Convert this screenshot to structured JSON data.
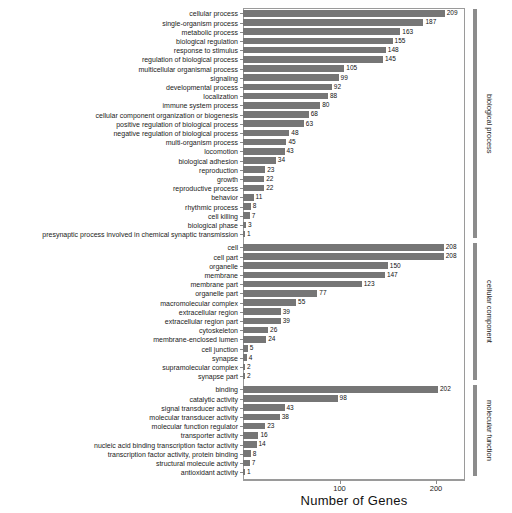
{
  "chart_data": {
    "type": "bar",
    "orientation": "horizontal",
    "title": "",
    "xlabel": "Number of Genes",
    "ylabel": "",
    "xlim": [
      0,
      230
    ],
    "xticks": [
      100,
      200
    ],
    "grid": false,
    "legend": "none",
    "bar_color": "#767676",
    "categories": [
      "cellular process",
      "single-organism process",
      "metabolic process",
      "biological regulation",
      "response to stimulus",
      "regulation of biological process",
      "multicellular organismal process",
      "signaling",
      "developmental process",
      "localization",
      "immune system process",
      "cellular component organization or biogenesis",
      "positive regulation of biological process",
      "negative regulation of biological process",
      "multi-organism process",
      "locomotion",
      "biological adhesion",
      "reproduction",
      "growth",
      "reproductive process",
      "behavior",
      "rhythmic process",
      "cell killing",
      "biological phase",
      "presynaptic process involved in chemical synaptic transmission",
      "cell",
      "cell part",
      "organelle",
      "membrane",
      "membrane part",
      "organelle part",
      "macromolecular complex",
      "extracellular region",
      "extracellular region part",
      "cytoskeleton",
      "membrane-enclosed lumen",
      "cell junction",
      "synapse",
      "supramolecular complex",
      "synapse part",
      "binding",
      "catalytic activity",
      "signal transducer activity",
      "molecular transducer activity",
      "molecular function regulator",
      "transporter activity",
      "nucleic acid binding transcription factor activity",
      "transcription factor activity, protein binding",
      "structural molecule activity",
      "antioxidant activity"
    ],
    "values": [
      209,
      187,
      163,
      155,
      148,
      145,
      105,
      99,
      92,
      88,
      80,
      68,
      63,
      48,
      45,
      43,
      34,
      23,
      22,
      22,
      11,
      8,
      7,
      3,
      1,
      208,
      208,
      150,
      147,
      123,
      77,
      55,
      39,
      39,
      26,
      24,
      5,
      4,
      2,
      2,
      202,
      98,
      43,
      38,
      23,
      16,
      14,
      8,
      7,
      1
    ],
    "groups": [
      {
        "name": "biological process",
        "start": 0,
        "end": 24
      },
      {
        "name": "cellular component",
        "start": 25,
        "end": 39
      },
      {
        "name": "molecular function",
        "start": 40,
        "end": 49
      }
    ]
  }
}
